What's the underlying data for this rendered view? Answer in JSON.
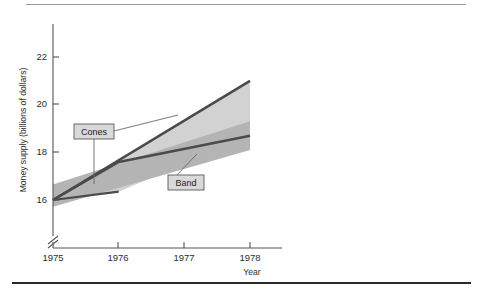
{
  "figure": {
    "ghost_header": "",
    "divider_top_color": "#9a9a9a",
    "divider_bottom_color": "#2a2a2a"
  },
  "chart_data": {
    "type": "area",
    "title": "",
    "xlabel": "Year",
    "ylabel": "Money supply (billions of dollars)",
    "x": [
      1975,
      1976,
      1977,
      1978
    ],
    "xtick_labels": [
      "1975",
      "1976",
      "1977",
      "1978"
    ],
    "ytick_labels": [
      "16",
      "18",
      "20",
      "22"
    ],
    "ytick_values": [
      16,
      18,
      20,
      22
    ],
    "xlim": [
      1975,
      1978
    ],
    "ylim": [
      16,
      22
    ],
    "y_axis_break": true,
    "grid": false,
    "legend": "none",
    "series": [
      {
        "name": "Cones",
        "kind": "cone",
        "fill_color": "#d2d2d2",
        "line_color": "#4a4a4a",
        "apex": {
          "x": 1975,
          "y": 16.0
        },
        "center_line": [
          {
            "x": 1975,
            "y": 16.0
          },
          {
            "x": 1978,
            "y": 21.0
          }
        ],
        "upper_bound": [
          {
            "x": 1975,
            "y": 16.0
          },
          {
            "x": 1978,
            "y": 21.0
          }
        ],
        "lower_bound": [
          {
            "x": 1975,
            "y": 16.0
          },
          {
            "x": 1976,
            "y": 16.35
          },
          {
            "x": 1978,
            "y": 18.7
          }
        ]
      },
      {
        "name": "Band",
        "kind": "band",
        "fill_color": "#b4b4b4",
        "line_color": "#4a4a4a",
        "center_line": [
          {
            "x": 1975,
            "y": 16.0
          },
          {
            "x": 1976,
            "y": 17.6
          },
          {
            "x": 1978,
            "y": 18.7
          }
        ],
        "upper_bound": [
          {
            "x": 1975,
            "y": 16.65
          },
          {
            "x": 1978,
            "y": 19.3
          }
        ],
        "lower_bound": [
          {
            "x": 1975,
            "y": 15.72
          },
          {
            "x": 1978,
            "y": 18.1
          }
        ]
      }
    ],
    "annotations": [
      {
        "label": "Cones",
        "box_x": 74,
        "box_y": 124,
        "box_w": 40,
        "box_h": 15,
        "leaders": [
          {
            "x1": 114,
            "y1": 130,
            "x2": 176,
            "y2": 115
          },
          {
            "x1": 94,
            "y1": 139,
            "x2": 94,
            "y2": 183
          }
        ]
      },
      {
        "label": "Band",
        "box_x": 168,
        "box_y": 175,
        "box_w": 36,
        "box_h": 15,
        "leaders": [
          {
            "x1": 176,
            "y1": 175,
            "x2": 196,
            "y2": 155
          }
        ]
      }
    ],
    "colors": {
      "cone_fill": "#d2d2d2",
      "band_fill": "#b4b4b4",
      "line": "#4a4a4a",
      "axis": "#555555",
      "callout_fill": "#d9d9d9",
      "callout_stroke": "#5a5a5a",
      "background": "#ffffff"
    }
  }
}
